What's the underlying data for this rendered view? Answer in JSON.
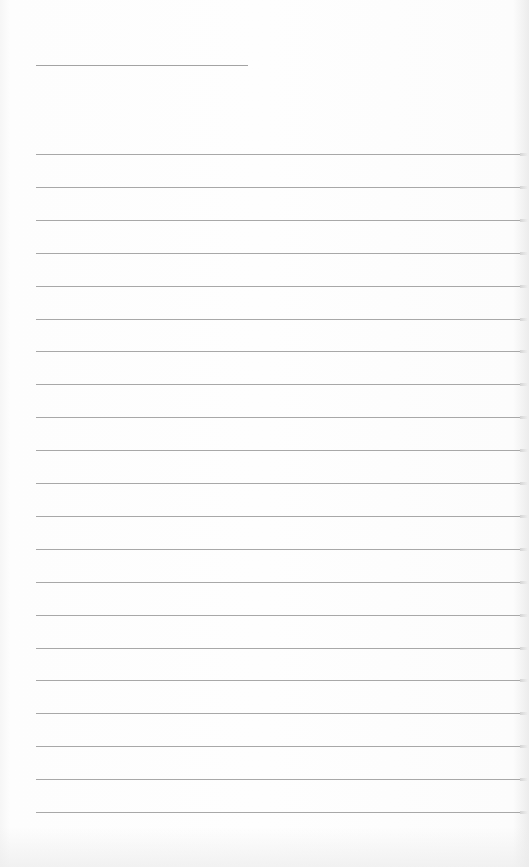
{
  "document": {
    "type": "blank-lined-sheet",
    "background_color": "#fdfdfd",
    "line_color": "#a8a8a8",
    "title_line": {
      "label": "",
      "x": 36,
      "y": 65,
      "width": 212
    },
    "ruled_lines": {
      "count": 21,
      "x": 36,
      "first_y": 154,
      "spacing": 32.9,
      "width": 484,
      "entries": [
        "",
        "",
        "",
        "",
        "",
        "",
        "",
        "",
        "",
        "",
        "",
        "",
        "",
        "",
        "",
        "",
        "",
        "",
        "",
        "",
        ""
      ]
    }
  }
}
